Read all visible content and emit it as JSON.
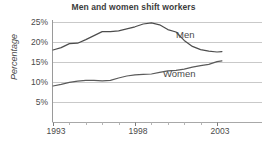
{
  "chart_data": {
    "type": "line",
    "title": "Men and women shift workers",
    "xlabel": "",
    "ylabel": "Percentage",
    "ylim": [
      0,
      25
    ],
    "xlim": [
      1993,
      2003.6
    ],
    "grid": true,
    "grid_axis": "y",
    "legend_position": "inline-right",
    "y_ticks": [
      25,
      20,
      15,
      10,
      5
    ],
    "y_tick_labels": [
      "25%",
      "20%",
      "15%",
      "10%",
      "5%"
    ],
    "x_ticks": [
      1993,
      1998,
      2003
    ],
    "x_tick_labels": [
      "1993",
      "1998",
      "2003"
    ],
    "x_minor_ticks": [
      1994,
      1995,
      1996,
      1997,
      1999,
      2000,
      2001,
      2002
    ],
    "x": [
      1993,
      1993.5,
      1994,
      1994.5,
      1995,
      1995.5,
      1996,
      1996.5,
      1997,
      1997.5,
      1998,
      1998.5,
      1999,
      1999.5,
      2000,
      2000.5,
      2001,
      2001.5,
      2002,
      2002.5,
      2003,
      2003.3
    ],
    "series": [
      {
        "name": "Men",
        "color": "#4d4d4d",
        "values": [
          18.0,
          18.6,
          19.6,
          19.7,
          20.6,
          21.6,
          22.6,
          22.6,
          22.8,
          23.3,
          23.8,
          24.5,
          24.8,
          24.3,
          23.1,
          22.5,
          20.4,
          18.9,
          18.1,
          17.7,
          17.5,
          17.6
        ]
      },
      {
        "name": "Women",
        "color": "#5a5a5a",
        "values": [
          9.0,
          9.4,
          9.9,
          10.2,
          10.4,
          10.4,
          10.3,
          10.4,
          11.0,
          11.5,
          11.8,
          11.9,
          12.0,
          12.4,
          12.8,
          12.9,
          13.2,
          13.7,
          14.1,
          14.4,
          15.1,
          15.3
        ]
      }
    ],
    "annotations": [
      {
        "text": "Men",
        "series": "Men"
      },
      {
        "text": "Women",
        "series": "Women"
      }
    ]
  }
}
